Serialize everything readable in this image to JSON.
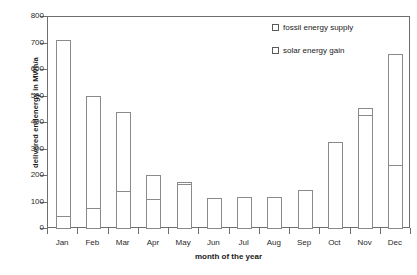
{
  "chart_data": {
    "type": "bar",
    "title": "",
    "subtitle": "",
    "xlabel": "month of the year",
    "ylabel": "delivered endenergy in MWh/a",
    "ylim": [
      0,
      800
    ],
    "ytick_step": 100,
    "ytick_labels": [
      "800",
      "700",
      "600",
      "500",
      "400",
      "300",
      "200",
      "100",
      "0"
    ],
    "ytick_values": [
      800,
      700,
      600,
      500,
      400,
      300,
      200,
      100,
      0
    ],
    "grid": false,
    "stacked": true,
    "legend_position": "top-right",
    "categories": [
      "Jan",
      "Feb",
      "Mar",
      "Apr",
      "May",
      "Jun",
      "Jul",
      "Aug",
      "Sep",
      "Oct",
      "Nov",
      "Dec"
    ],
    "series": [
      {
        "name": "solar energy gain",
        "values": [
          50,
          78,
          142,
          113,
          168,
          118,
          120,
          122,
          148,
          330,
          432,
          240
        ]
      },
      {
        "name": "fossil energy supply",
        "values": [
          665,
          425,
          298,
          90,
          10,
          0,
          0,
          0,
          0,
          0,
          23,
          420
        ]
      }
    ],
    "totals": [
      715,
      503,
      440,
      203,
      178,
      118,
      120,
      122,
      148,
      330,
      455,
      660
    ]
  },
  "legend": {
    "items": [
      {
        "label": "fossil energy supply",
        "marker": "empty-square"
      },
      {
        "label": "solar energy gain",
        "marker": "empty-square"
      }
    ]
  },
  "colors": {
    "frame": "#6e6e6e",
    "bar_outline": "#8a8a8a",
    "bar_fill": "#ffffff",
    "text": "#1a1a1a",
    "background": "#ffffff"
  }
}
